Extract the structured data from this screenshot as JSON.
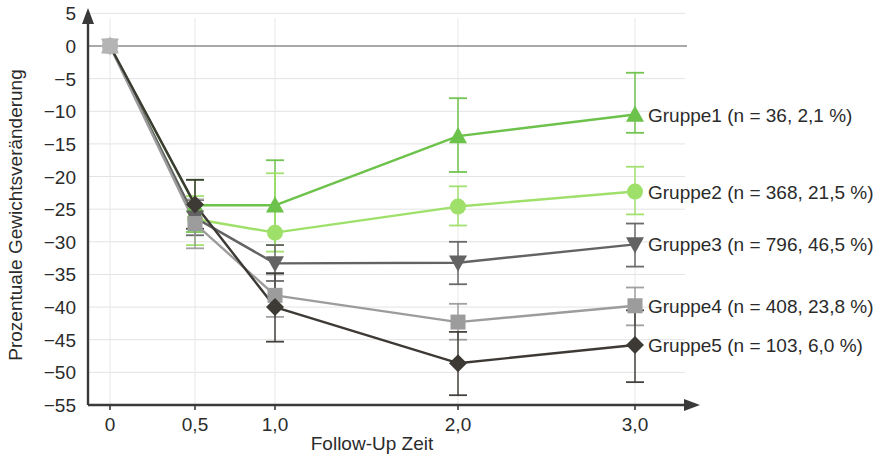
{
  "chart_data": {
    "type": "line",
    "title": "",
    "xlabel": "Follow-Up Zeit",
    "ylabel": "Prozentuale Gewichtsveränderung",
    "x": [
      0,
      0.5,
      1.0,
      2.0,
      3.0
    ],
    "x_tick_labels": [
      "0",
      "0,5",
      "1,0",
      "2,0",
      "3,0"
    ],
    "y_tick_labels": [
      "5",
      "0",
      "-5",
      "-10",
      "-15",
      "-20",
      "-25",
      "-30",
      "-35",
      "-40",
      "-45",
      "-50",
      "-55"
    ],
    "y_ticks": [
      5,
      0,
      -5,
      -10,
      -15,
      -20,
      -25,
      -30,
      -35,
      -40,
      -45,
      -50,
      -55
    ],
    "ylim": [
      -55,
      5
    ],
    "xlim": [
      0,
      3.0
    ],
    "grid": true,
    "legend_position": "right",
    "zero_line": true,
    "series": [
      {
        "name": "Gruppe1",
        "label": "Gruppe1 (n = 36, 2,1 %)",
        "n": 36,
        "percent": "2,1 %",
        "color": "#6cc24a",
        "marker": "triangle-up",
        "values": [
          0,
          -24.4,
          -24.4,
          -13.8,
          -10.5
        ],
        "err_low": [
          0,
          -28.5,
          -30.5,
          -19.3,
          -13.3
        ],
        "err_high": [
          0,
          -20.5,
          -17.5,
          -8.0,
          -4.1
        ]
      },
      {
        "name": "Gruppe2",
        "label": "Gruppe2 (n = 368, 21,5 %)",
        "n": 368,
        "percent": "21,5 %",
        "color": "#9fe06a",
        "marker": "circle",
        "values": [
          0,
          -26.5,
          -28.6,
          -24.6,
          -22.3
        ],
        "err_low": [
          0,
          -30.5,
          -31.5,
          -27.5,
          -25.8
        ],
        "err_high": [
          0,
          -23.0,
          -19.5,
          -21.5,
          -18.5
        ]
      },
      {
        "name": "Gruppe3",
        "label": "Gruppe3 (n = 796, 46,5 %)",
        "n": 796,
        "percent": "46,5 %",
        "color": "#636363",
        "marker": "triangle-down",
        "values": [
          0,
          -26.3,
          -33.3,
          -33.2,
          -30.4
        ],
        "err_low": [
          0,
          -29.0,
          -36.0,
          -36.5,
          -33.8
        ],
        "err_high": [
          0,
          -23.6,
          -30.5,
          -30.0,
          -27.2
        ]
      },
      {
        "name": "Gruppe4",
        "label": "Gruppe4 (n = 408, 23,8 %)",
        "n": 408,
        "percent": "23,8 %",
        "color": "#9c9c9c",
        "marker": "square",
        "values": [
          0,
          -27.2,
          -38.2,
          -42.3,
          -39.8
        ],
        "err_low": [
          0,
          -31.0,
          -41.5,
          -45.0,
          -42.8
        ],
        "err_high": [
          0,
          -23.5,
          -35.0,
          -39.5,
          -37.0
        ]
      },
      {
        "name": "Gruppe5",
        "label": "Gruppe5 (n = 103, 6,0 %)",
        "n": 103,
        "percent": "6,0 %",
        "color": "#3d3935",
        "marker": "diamond",
        "values": [
          0,
          -24.3,
          -40.0,
          -48.6,
          -45.8
        ],
        "err_low": [
          0,
          -28.0,
          -45.3,
          -53.5,
          -51.5
        ],
        "err_high": [
          0,
          -20.5,
          -34.8,
          -43.8,
          -40.5
        ]
      }
    ]
  },
  "axis": {
    "y_title": "Prozentuale Gewichtsveränderung",
    "x_title": "Follow-Up Zeit"
  },
  "legend": {
    "items": [
      "Gruppe1 (n = 36, 2,1 %)",
      "Gruppe2 (n = 368, 21,5 %)",
      "Gruppe3 (n = 796, 46,5 %)",
      "Gruppe4 (n = 408, 23,8 %)",
      "Gruppe5 (n = 103, 6,0 %)"
    ]
  }
}
